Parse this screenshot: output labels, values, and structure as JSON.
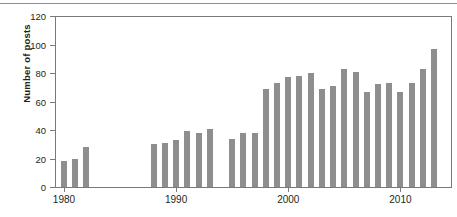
{
  "chart_data": {
    "type": "bar",
    "title": "",
    "xlabel": "",
    "ylabel": "Number of posts",
    "ylim": [
      0,
      120
    ],
    "xlim": [
      1979.2,
      2014.6
    ],
    "yticks": [
      0,
      20,
      40,
      60,
      80,
      100,
      120
    ],
    "ytick_labels": [
      "0",
      "20",
      "40",
      "60",
      "80",
      "100",
      "120"
    ],
    "xticks": [
      1980,
      1990,
      2000,
      2010
    ],
    "xtick_labels": [
      "1980",
      "1990",
      "2000",
      "2010"
    ],
    "grid": false,
    "legend": null,
    "bar_color": "#8e8e8e",
    "axis_color": "#7a7a7a",
    "categories": [
      1980,
      1981,
      1982,
      1988,
      1989,
      1990,
      1991,
      1992,
      1993,
      1995,
      1996,
      1997,
      1998,
      1999,
      2000,
      2001,
      2002,
      2003,
      2004,
      2005,
      2006,
      2007,
      2008,
      2009,
      2010,
      2011,
      2012,
      2013
    ],
    "values": [
      18,
      20,
      28,
      30,
      31,
      33,
      39,
      38,
      41,
      34,
      38,
      38,
      69,
      73,
      77,
      78,
      80,
      69,
      71,
      83,
      81,
      67,
      72,
      73,
      67,
      73,
      83,
      97
    ],
    "missing_years": [
      1983,
      1984,
      1985,
      1986,
      1987,
      1994,
      2014
    ]
  }
}
